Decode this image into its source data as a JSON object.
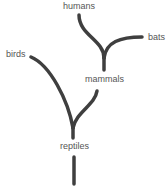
{
  "diagram": {
    "type": "evolutionary-tree",
    "line_color": "#3f3f3f",
    "text_color": "#555555",
    "nodes": {
      "humans": "humans",
      "bats": "bats",
      "mammals": "mammals",
      "birds": "birds",
      "reptiles": "reptiles"
    },
    "edges": [
      {
        "from": "reptiles",
        "to": "birds"
      },
      {
        "from": "reptiles",
        "to": "mammals"
      },
      {
        "from": "mammals",
        "to": "humans"
      },
      {
        "from": "mammals",
        "to": "bats"
      }
    ]
  }
}
